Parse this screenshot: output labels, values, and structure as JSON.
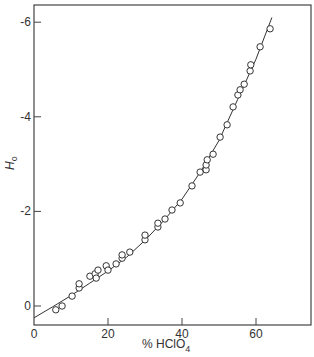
{
  "chart_data": {
    "type": "scatter",
    "title": "",
    "xlabel": "% HClO4",
    "xlabel_main": "% HClO",
    "xlabel_sub": "4",
    "ylabel": "H0",
    "ylabel_main": "H",
    "ylabel_sub": "o",
    "xlim": [
      0,
      75
    ],
    "ylim": [
      0.4,
      -6.5
    ],
    "y_axis_inverted": true,
    "grid": false,
    "legend": null,
    "x_ticks": [
      0,
      20,
      40,
      60
    ],
    "x_tick_labels": [
      "0",
      "20",
      "40",
      "60"
    ],
    "y_ticks": [
      0,
      -2,
      -4,
      -6
    ],
    "y_tick_labels": [
      "0",
      "-2",
      "-4",
      "-6"
    ],
    "series": [
      {
        "name": "measured",
        "marker": "open-circle",
        "x": [
          5.9,
          7.6,
          10.3,
          12.2,
          12.2,
          15.1,
          16.5,
          16.8,
          17.3,
          19.5,
          20.0,
          22.2,
          23.8,
          23.8,
          25.9,
          30.0,
          30.0,
          33.5,
          33.5,
          35.4,
          37.3,
          39.5,
          42.7,
          44.9,
          46.5,
          46.5,
          46.8,
          48.4,
          50.3,
          52.2,
          53.8,
          55.1,
          55.7,
          56.8,
          58.4,
          58.6,
          61.1,
          63.8
        ],
        "y": [
          0.08,
          0.0,
          -0.21,
          -0.38,
          -0.47,
          -0.63,
          -0.68,
          -0.59,
          -0.76,
          -0.85,
          -0.76,
          -0.89,
          -1.01,
          -1.08,
          -1.14,
          -1.4,
          -1.5,
          -1.67,
          -1.75,
          -1.84,
          -2.03,
          -2.18,
          -2.54,
          -2.83,
          -2.88,
          -2.98,
          -3.09,
          -3.21,
          -3.57,
          -3.83,
          -4.21,
          -4.46,
          -4.57,
          -4.69,
          -4.97,
          -5.1,
          -5.48,
          -5.86
        ]
      },
      {
        "name": "fitted curve",
        "marker": "line",
        "x": [
          0,
          5,
          10,
          15,
          20,
          25,
          30,
          35,
          40,
          45,
          50,
          55,
          60,
          64.3
        ],
        "y": [
          0.25,
          0.02,
          -0.22,
          -0.48,
          -0.74,
          -1.03,
          -1.39,
          -1.8,
          -2.26,
          -2.84,
          -3.5,
          -4.36,
          -5.22,
          -6.1
        ]
      }
    ]
  }
}
